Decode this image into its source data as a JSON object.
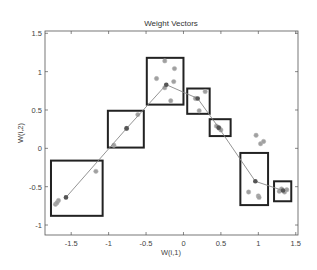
{
  "chart_data": {
    "type": "scatter",
    "title": "Weight Vectors",
    "xlabel": "W(i,1)",
    "ylabel": "W(i,2)",
    "xlim": [
      -1.85,
      1.53
    ],
    "ylim": [
      -1.13,
      1.53
    ],
    "xticks": [
      -1.5,
      -1,
      -0.5,
      0,
      0.5,
      1,
      1.5
    ],
    "xtick_labels": [
      "-1.5",
      "-1",
      "-0.5",
      "0",
      "0.5",
      "1",
      "1.5"
    ],
    "yticks": [
      -1,
      -0.5,
      0,
      0.5,
      1,
      1.5
    ],
    "ytick_labels": [
      "-1",
      "-0.5",
      "0",
      "0.5",
      "1",
      "1.5"
    ],
    "grid": false,
    "legend": null,
    "series": [
      {
        "name": "weights",
        "style": "line-with-dark-markers",
        "color": "#555555",
        "points": [
          [
            -1.57,
            -0.64
          ],
          [
            -0.76,
            0.26
          ],
          [
            -0.23,
            0.83
          ],
          [
            0.19,
            0.65
          ],
          [
            0.47,
            0.27
          ],
          [
            0.96,
            -0.43
          ],
          [
            1.33,
            -0.55
          ]
        ]
      },
      {
        "name": "inputs",
        "style": "light-gray-markers",
        "color": "#9a9a9a",
        "points": [
          [
            -1.17,
            -0.3
          ],
          [
            -1.67,
            -0.68
          ],
          [
            -1.71,
            -0.73
          ],
          [
            -1.69,
            -0.71
          ],
          [
            -0.61,
            0.44
          ],
          [
            -0.76,
            0.26
          ],
          [
            -0.93,
            0.04
          ],
          [
            -0.25,
            1.14
          ],
          [
            -0.12,
            1.04
          ],
          [
            -0.36,
            0.91
          ],
          [
            -0.13,
            0.87
          ],
          [
            -0.25,
            0.79
          ],
          [
            -0.17,
            0.62
          ],
          [
            0.29,
            0.74
          ],
          [
            0.16,
            0.65
          ],
          [
            0.21,
            0.49
          ],
          [
            0.44,
            0.29
          ],
          [
            0.48,
            0.26
          ],
          [
            0.5,
            0.24
          ],
          [
            0.97,
            0.17
          ],
          [
            1.03,
            0.06
          ],
          [
            1.07,
            0.09
          ],
          [
            0.87,
            -0.57
          ],
          [
            1.0,
            -0.62
          ],
          [
            1.01,
            -0.64
          ],
          [
            1.28,
            -0.56
          ],
          [
            1.31,
            -0.53
          ],
          [
            1.35,
            -0.57
          ],
          [
            1.38,
            -0.54
          ]
        ]
      }
    ],
    "boxes": [
      {
        "x": [
          -1.77,
          -1.08
        ],
        "y": [
          -0.88,
          -0.16
        ]
      },
      {
        "x": [
          -1.01,
          -0.53
        ],
        "y": [
          0.01,
          0.49
        ]
      },
      {
        "x": [
          -0.49,
          0.0
        ],
        "y": [
          0.57,
          1.18
        ]
      },
      {
        "x": [
          0.05,
          0.35
        ],
        "y": [
          0.45,
          0.78
        ]
      },
      {
        "x": [
          0.35,
          0.63
        ],
        "y": [
          0.16,
          0.38
        ]
      },
      {
        "x": [
          0.76,
          1.13
        ],
        "y": [
          -0.74,
          -0.06
        ]
      },
      {
        "x": [
          1.21,
          1.44
        ],
        "y": [
          -0.69,
          -0.43
        ]
      }
    ]
  },
  "colors": {
    "axis": "#555555",
    "box": "#222222",
    "weight_line": "#888888",
    "weight_marker": "#555555",
    "input_marker": "#a0a0a0"
  }
}
